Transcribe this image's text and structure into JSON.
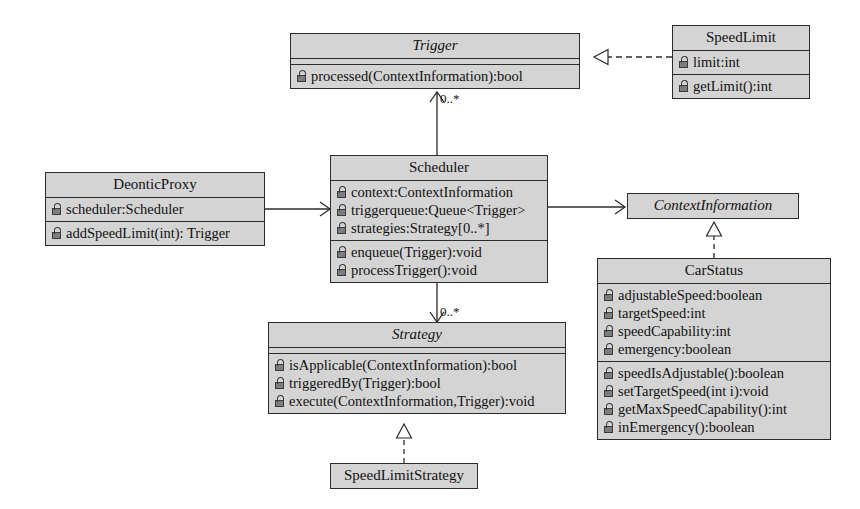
{
  "diagram": {
    "fill_color": "#d4d4d4",
    "line_color": "#2b2b2b",
    "background": "#ffffff"
  },
  "classes": {
    "trigger": {
      "name": "Trigger",
      "abstract": true,
      "attributes": [],
      "methods": [
        {
          "visibility": "protected-lock",
          "text": "processed(ContextInformation):bool"
        }
      ]
    },
    "speedlimit": {
      "name": "SpeedLimit",
      "abstract": false,
      "attributes": [
        {
          "visibility": "protected-lock",
          "text": "limit:int"
        }
      ],
      "methods": [
        {
          "visibility": "protected-lock",
          "text": "getLimit():int"
        }
      ]
    },
    "deonticproxy": {
      "name": "DeonticProxy",
      "abstract": false,
      "attributes": [
        {
          "visibility": "protected-lock",
          "text": "scheduler:Scheduler"
        }
      ],
      "methods": [
        {
          "visibility": "protected-lock",
          "text": "addSpeedLimit(int): Trigger"
        }
      ]
    },
    "scheduler": {
      "name": "Scheduler",
      "abstract": false,
      "attributes": [
        {
          "visibility": "protected-lock",
          "text": "context:ContextInformation"
        },
        {
          "visibility": "protected-lock",
          "text": "triggerqueue:Queue<Trigger>"
        },
        {
          "visibility": "protected-lock",
          "text": "strategies:Strategy[0..*]"
        }
      ],
      "methods": [
        {
          "visibility": "protected-lock",
          "text": "enqueue(Trigger):void"
        },
        {
          "visibility": "protected-lock",
          "text": "processTrigger():void"
        }
      ]
    },
    "contextinformation": {
      "name": "ContextInformation",
      "abstract": true,
      "attributes": [],
      "methods": []
    },
    "carstatus": {
      "name": "CarStatus",
      "abstract": false,
      "attributes": [
        {
          "visibility": "protected-lock",
          "text": "adjustableSpeed:boolean"
        },
        {
          "visibility": "protected-lock",
          "text": "targetSpeed:int"
        },
        {
          "visibility": "protected-lock",
          "text": "speedCapability:int"
        },
        {
          "visibility": "protected-lock",
          "text": "emergency:boolean"
        }
      ],
      "methods": [
        {
          "visibility": "protected-lock",
          "text": "speedIsAdjustable():boolean"
        },
        {
          "visibility": "protected-lock",
          "text": "setTargetSpeed(int i):void"
        },
        {
          "visibility": "protected-lock",
          "text": "getMaxSpeedCapability():int"
        },
        {
          "visibility": "protected-lock",
          "text": "inEmergency():boolean"
        }
      ]
    },
    "strategy": {
      "name": "Strategy",
      "abstract": true,
      "attributes": [],
      "methods": [
        {
          "visibility": "protected-lock",
          "text": "isApplicable(ContextInformation):bool"
        },
        {
          "visibility": "protected-lock",
          "text": "triggeredBy(Trigger):bool"
        },
        {
          "visibility": "protected-lock",
          "text": "execute(ContextInformation,Trigger):void"
        }
      ]
    },
    "speedlimitstrategy": {
      "name": "SpeedLimitStrategy",
      "abstract": false,
      "attributes": [],
      "methods": []
    }
  },
  "relations": {
    "scheduler_to_trigger": {
      "kind": "association",
      "multiplicity": "0..*"
    },
    "scheduler_to_strategy": {
      "kind": "association",
      "multiplicity": "0..*"
    },
    "speedlimit_to_trigger": {
      "kind": "realization",
      "multiplicity": ""
    },
    "deonticproxy_to_scheduler": {
      "kind": "association",
      "multiplicity": ""
    },
    "scheduler_to_contextinformation": {
      "kind": "association",
      "multiplicity": ""
    },
    "carstatus_to_contextinformation": {
      "kind": "realization",
      "multiplicity": ""
    },
    "speedlimitstrategy_to_strategy": {
      "kind": "realization",
      "multiplicity": ""
    }
  }
}
